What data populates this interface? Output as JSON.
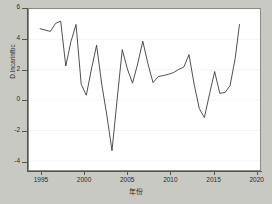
{
  "chart_data": {
    "type": "line",
    "title": "",
    "xlabel": "年份",
    "ylabel": "D.lncarinfbc",
    "xlim": [
      1993.5,
      2020.5
    ],
    "ylim": [
      -4.6,
      6.0
    ],
    "xticks": [
      1995,
      2000,
      2005,
      2010,
      2015,
      2020
    ],
    "xtick_labels": [
      "1995",
      "2000",
      "2005",
      "2010",
      "2015",
      "2020"
    ],
    "yticks": [
      -4,
      -2,
      0,
      2,
      4,
      6
    ],
    "ytick_labels": [
      "-4",
      "-2",
      "0",
      "2",
      "4",
      "6"
    ],
    "grid": "horizontal",
    "legend": "none",
    "line_color": "#3a3a38",
    "series": [
      {
        "name": "D.lncarinfbc",
        "x": [
          1994.8,
          1995.5,
          1996.0,
          1996.6,
          1997.2,
          1997.8,
          1998.4,
          1999.0,
          1999.6,
          2000.2,
          2000.8,
          2001.4,
          2002.0,
          2002.6,
          2003.2,
          2003.8,
          2004.4,
          2005.0,
          2005.6,
          2006.2,
          2006.8,
          2007.4,
          2008.0,
          2008.6,
          2009.2,
          2009.8,
          2010.4,
          2011.0,
          2011.6,
          2012.2,
          2012.8,
          2013.4,
          2014.0,
          2014.6,
          2015.2,
          2015.8,
          2016.4,
          2017.0,
          2017.6,
          2018.1
        ],
        "y": [
          4.7,
          4.6,
          4.52,
          5.05,
          5.2,
          2.25,
          3.85,
          4.98,
          1.05,
          0.32,
          2.05,
          3.62,
          1.05,
          -1.0,
          -3.33,
          0.05,
          3.32,
          2.05,
          1.12,
          2.38,
          3.88,
          2.4,
          1.15,
          1.55,
          1.62,
          1.7,
          1.82,
          2.02,
          2.18,
          3.0,
          1.05,
          -0.55,
          -1.15,
          0.4,
          1.88,
          0.45,
          0.5,
          0.95,
          2.75,
          4.98
        ],
        "x_range_label": "1995-2018"
      }
    ]
  },
  "axes": {
    "y_title": "D.lncarinfbc",
    "x_title": "年份",
    "ytick_labels": [
      "6",
      "4",
      "2",
      "0",
      "-2",
      "-4"
    ],
    "ytick_values": [
      6,
      4,
      2,
      0,
      -2,
      -4
    ],
    "xtick_labels": [
      "1995",
      "2000",
      "2005",
      "2010",
      "2015",
      "2020"
    ],
    "xtick_values": [
      1995,
      2000,
      2005,
      2010,
      2015,
      2020
    ]
  },
  "style": {
    "background": "#c9c9c4",
    "panel": "#ffffff",
    "line": "#3a3a38",
    "grid": "#efefef",
    "axis": "#55554f"
  }
}
